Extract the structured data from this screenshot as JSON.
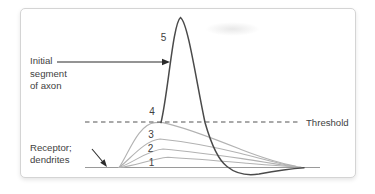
{
  "colors": {
    "page_bg": "#ffffff",
    "card_bg": "#ffffff",
    "card_border": "#d4d4d4",
    "graded_curve": "#b2b2b2",
    "action_curve": "#4a4a4a",
    "baseline": "#9a9a9a",
    "threshold_line": "#555555",
    "arrow": "#2b2b2b",
    "text": "#414141"
  },
  "figure": {
    "annotations": {
      "initial_segment": {
        "line1": "Initial",
        "line2": "segment",
        "line3": "of axon"
      },
      "receptor": {
        "line1": "Receptor;",
        "line2": "dendrites"
      },
      "threshold_label": "Threshold"
    },
    "curve_labels": [
      "1",
      "2",
      "3",
      "4",
      "5"
    ]
  }
}
